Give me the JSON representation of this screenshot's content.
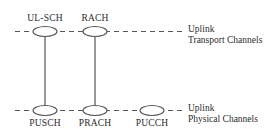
{
  "diagram": {
    "stroke_color": "#555555",
    "text_color": "#2b2b2b",
    "background": "#ffffff",
    "transport_layer": {
      "label_line1": "Uplink",
      "label_line2": "Transport Channels",
      "nodes": [
        {
          "id": "ul-sch",
          "label": "UL-SCH",
          "cx": 45,
          "cy": 31
        },
        {
          "id": "rach",
          "label": "RACH",
          "cx": 95,
          "cy": 31
        }
      ]
    },
    "physical_layer": {
      "label_line1": "Uplink",
      "label_line2": "Physical Channels",
      "nodes": [
        {
          "id": "pusch",
          "label": "PUSCH",
          "cx": 45,
          "cy": 110
        },
        {
          "id": "prach",
          "label": "PRACH",
          "cx": 95,
          "cy": 110
        },
        {
          "id": "pucch",
          "label": "PUCCH",
          "cx": 152,
          "cy": 110
        }
      ]
    },
    "connections": [
      {
        "from": "ul-sch",
        "to": "pusch"
      },
      {
        "from": "rach",
        "to": "prach"
      }
    ]
  }
}
